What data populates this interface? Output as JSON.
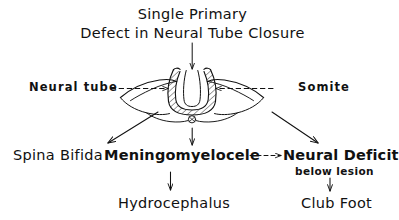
{
  "diagram": {
    "title": {
      "line1": "Single Primary",
      "line2": "Defect in Neural Tube Closure"
    },
    "illustration": {
      "caption_left": "Neural tube",
      "caption_right": "Somite",
      "description": "Cross-section of an open neural tube with hatched neural folds, lateral somite wings and notochord below"
    },
    "outcomes": {
      "spina_bifida": "Spina Bifida",
      "meningomyelocele": "Meningomyelocele",
      "neural_deficit": "Neural Deficit",
      "neural_deficit_sub": "below lesion",
      "hydrocephalus": "Hydrocephalus",
      "club_foot": "Club Foot"
    },
    "colors": {
      "ink": "#111111",
      "background": "#ffffff"
    }
  }
}
